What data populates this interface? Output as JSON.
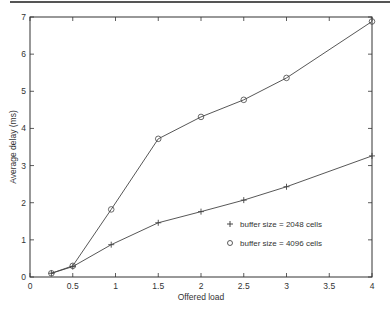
{
  "chart_data": {
    "type": "line",
    "title": "",
    "xlabel": "Offered load",
    "ylabel": "Average delay (ms)",
    "xlim": [
      0,
      4
    ],
    "ylim": [
      0,
      7
    ],
    "xticks": [
      0,
      0.5,
      1,
      1.5,
      2,
      2.5,
      3,
      3.5,
      4
    ],
    "xtick_labels": [
      "0",
      "0.5",
      "1",
      "1.5",
      "2",
      "2.5",
      "3",
      "3.5",
      "4"
    ],
    "yticks": [
      0,
      1,
      2,
      3,
      4,
      5,
      6,
      7
    ],
    "ytick_labels": [
      "0",
      "1",
      "2",
      "3",
      "4",
      "5",
      "6",
      "7"
    ],
    "grid": false,
    "legend_position": "inside lower right",
    "series": [
      {
        "name": "buffer size = 2048 cells",
        "marker": "+",
        "x": [
          0.25,
          0.5,
          0.95,
          1.5,
          2.0,
          2.5,
          3.0,
          4.0
        ],
        "values": [
          0.1,
          0.28,
          0.87,
          1.46,
          1.76,
          2.07,
          2.43,
          3.26
        ]
      },
      {
        "name": "buffer size = 4096 cells",
        "marker": "o",
        "x": [
          0.25,
          0.5,
          0.95,
          1.5,
          2.0,
          2.5,
          3.0,
          4.0
        ],
        "values": [
          0.1,
          0.3,
          1.82,
          3.72,
          4.31,
          4.77,
          5.36,
          6.88
        ]
      }
    ],
    "colors": {
      "line": "#444444",
      "axis": "#333333",
      "text": "#333333",
      "top_rule": "#555555"
    }
  },
  "legend": {
    "plus_symbol": "+",
    "circle_symbol": "o",
    "entries": [
      "buffer size = 2048 cells",
      "buffer size = 4096 cells"
    ]
  }
}
